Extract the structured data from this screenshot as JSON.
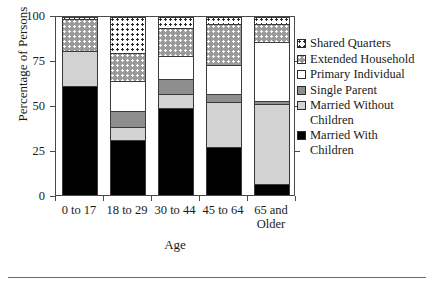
{
  "chart_data": {
    "type": "bar",
    "variant": "stacked",
    "title": "",
    "xlabel": "Age",
    "ylabel": "Percentage of Persons",
    "ylim": [
      0,
      100
    ],
    "yticks": [
      0,
      25,
      50,
      75,
      100
    ],
    "ytick_labels": [
      "0",
      "25",
      "50",
      "75",
      "100"
    ],
    "grid": false,
    "legend_position": "right",
    "categories": [
      "0 to 17",
      "18 to 29",
      "30 to 44",
      "45 to 64",
      "65 and\nOlder"
    ],
    "series": [
      {
        "name": "Married With Children",
        "fill": "fill-married-with",
        "color": "#000000",
        "values": [
          61,
          31,
          49,
          27,
          6
        ]
      },
      {
        "name": "Married Without Children",
        "fill": "fill-married-without",
        "color": "#d2d2d2",
        "values": [
          20,
          7,
          8,
          25,
          45
        ]
      },
      {
        "name": "Single Parent",
        "fill": "fill-single-parent",
        "color": "#8e8e8e",
        "values": [
          0,
          9,
          8,
          5,
          2
        ]
      },
      {
        "name": "Primary Individual",
        "fill": "fill-primary-individual",
        "color": "#ffffff",
        "values": [
          0,
          17,
          13,
          16,
          33
        ]
      },
      {
        "name": "Extended Household",
        "fill": "fill-extended-household",
        "color": "#9a9a9a",
        "values": [
          18,
          16,
          16,
          23,
          10
        ]
      },
      {
        "name": "Shared Quarters",
        "fill": "fill-shared-quarters",
        "color": "#ffffff",
        "values": [
          1,
          20,
          6,
          4,
          4
        ]
      }
    ],
    "legend_order": [
      "Shared Quarters",
      "Extended Household",
      "Primary Individual",
      "Single Parent",
      "Married Without\nChildren",
      "Married With\nChildren"
    ]
  },
  "legend": {
    "items": [
      {
        "label": "Shared Quarters",
        "fill": "fill-shared-quarters"
      },
      {
        "label": "Extended Household",
        "fill": "fill-extended-household"
      },
      {
        "label": "Primary Individual",
        "fill": "fill-primary-individual"
      },
      {
        "label": "Single Parent",
        "fill": "fill-single-parent"
      },
      {
        "label": "Married Without\nChildren",
        "fill": "fill-married-without"
      },
      {
        "label": "Married With\nChildren",
        "fill": "fill-married-with"
      }
    ]
  }
}
